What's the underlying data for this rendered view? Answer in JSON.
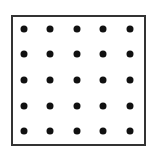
{
  "diagram": {
    "type": "dot-grid",
    "rows": 5,
    "cols": 5,
    "frame_color": "#333333",
    "dot_color": "#111111",
    "dots_x": [
      24,
      50,
      77,
      103,
      130
    ],
    "dots_y": [
      29,
      54,
      80,
      106,
      131
    ]
  }
}
